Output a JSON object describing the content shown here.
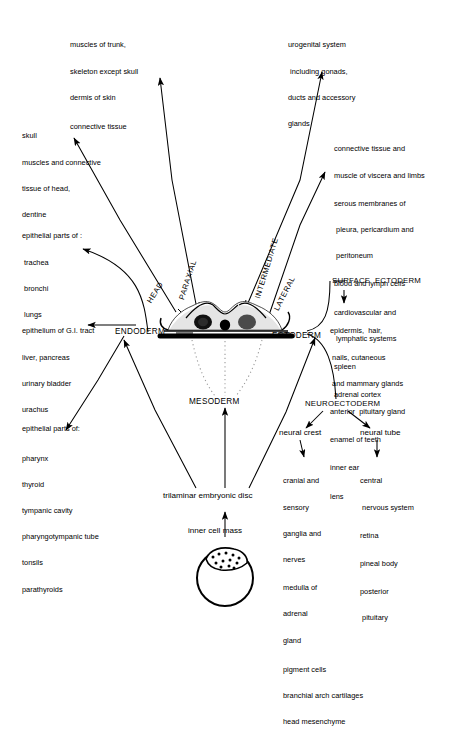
{
  "diagram": {
    "central_labels": {
      "endoderm": "ENDODERM",
      "ectoderm": "ECTODERM",
      "mesoderm": "MESODERM",
      "neuroectoderm": "NEUROECTODERM",
      "surface_ectoderm": "SURFACE  ECTODERM",
      "head": "HEAD",
      "paraxial": "PARAXIAL",
      "intermediate": "INTERMEDIATE",
      "lateral": "LATERAL",
      "trilaminar_disc": "trilaminar embryonic disc",
      "inner_cell_mass": "inner cell mass",
      "neural_crest": "neural crest",
      "neural_tube": "neural tube"
    },
    "lists": {
      "paraxial_trunk": [
        "muscles of trunk,",
        "skeleton except skull",
        "dermis of skin",
        "connective tissue"
      ],
      "head_mesoderm": [
        "skull",
        "muscles and connective",
        "tissue of head,",
        "dentine"
      ],
      "intermediate": [
        "urogenital system",
        " including gonads,",
        "ducts and accessory",
        "glands"
      ],
      "lateral_plate": [
        "connective tissue and",
        "muscle of viscera and limbs",
        "serous membranes of",
        " pleura, pericardium and",
        " peritoneum",
        "blood and lymph cells",
        "cardiovascular and",
        " lymphatic systems",
        "spleen",
        "adrenal cortex"
      ],
      "respiratory_endoderm": [
        "epithelial parts of :",
        " trachea",
        " bronchi",
        " lungs"
      ],
      "gut_endoderm": [
        "epithelium of G.I. tract",
        "liver, pancreas",
        "urinary bladder",
        "urachus"
      ],
      "pharyngeal_endoderm": [
        "epithelial parts of:",
        "pharynx",
        "thyroid",
        "tympanic cavity",
        "pharyngotympanic tube",
        "tonsils",
        "parathyroids"
      ],
      "surface_ectoderm": [
        "epidermis,  hair,",
        " nails, cutaneous",
        " and mammary glands",
        "anterior  pituitary gland",
        "enamel of teeth",
        "inner ear",
        "lens"
      ],
      "neural_crest": [
        "cranial and",
        "sensory",
        "ganglia and",
        "nerves",
        "medulla of",
        "adrenal",
        "gland",
        "pigment cells",
        "branchial arch cartilages",
        "head mesenchyme"
      ],
      "neural_tube": [
        "central",
        " nervous system",
        "retina",
        "pineal body",
        "posterior",
        " pituitary"
      ]
    },
    "colors": {
      "ink": "#000000",
      "paper": "#ffffff",
      "dotted": "#9a9a9a"
    }
  }
}
